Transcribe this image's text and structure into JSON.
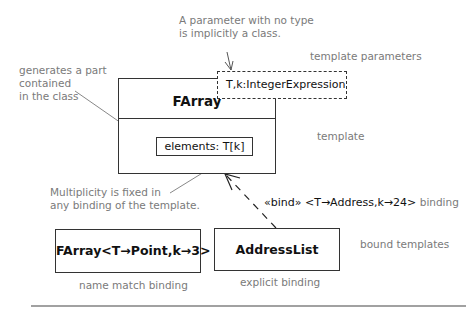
{
  "notes": {
    "param_no_type": [
      "A parameter with no type",
      "is implicitly a class."
    ],
    "template_parameters": "template parameters",
    "generates_part": [
      "generates a part",
      "contained",
      "in the class"
    ],
    "template": "template",
    "multiplicity": [
      "Multiplicity is fixed in",
      "any binding of the template."
    ],
    "bound_templates": "bound templates",
    "name_match_binding": "name match binding",
    "explicit_binding": "explicit binding",
    "binding": "binding"
  },
  "template_class": {
    "name": "FArray",
    "parameters": "T,k:IntegerExpression",
    "attribute": "elements: T[k]"
  },
  "bound_classes": {
    "name_match": "FArray<T→Point,k→3>",
    "explicit": "AddressList"
  },
  "bind_dependency": {
    "label": "«bind» <T→Address,k→24>"
  }
}
